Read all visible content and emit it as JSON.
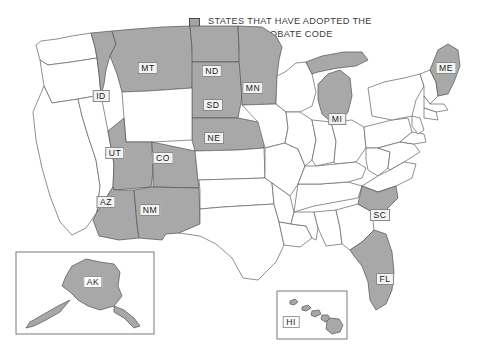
{
  "legend": {
    "swatch_icon": "filled-square-icon",
    "swatch_color": "#a8a8a8",
    "text": "STATES THAT HAVE ADOPTED THE\nUNIFORM PROBATE CODE"
  },
  "map": {
    "title": "Map of the United States",
    "adopted_fill": "#a8a8a8",
    "not_adopted_fill": "#ffffff",
    "border_color": "#6b6b6b",
    "adopted_count": 16,
    "adopted_states": [
      {
        "code": "MT",
        "x": 148,
        "y": 68
      },
      {
        "code": "ND",
        "x": 212,
        "y": 71
      },
      {
        "code": "MN",
        "x": 253,
        "y": 88
      },
      {
        "code": "ID",
        "x": 101,
        "y": 96
      },
      {
        "code": "SD",
        "x": 213,
        "y": 105
      },
      {
        "code": "NE",
        "x": 214,
        "y": 138
      },
      {
        "code": "UT",
        "x": 115,
        "y": 153
      },
      {
        "code": "CO",
        "x": 163,
        "y": 158
      },
      {
        "code": "AZ",
        "x": 106,
        "y": 202
      },
      {
        "code": "NM",
        "x": 150,
        "y": 210
      },
      {
        "code": "MI",
        "x": 337,
        "y": 119
      },
      {
        "code": "ME",
        "x": 446,
        "y": 68
      },
      {
        "code": "SC",
        "x": 380,
        "y": 215
      },
      {
        "code": "FL",
        "x": 385,
        "y": 279
      },
      {
        "code": "AK",
        "x": 93,
        "y": 282
      },
      {
        "code": "HI",
        "x": 291,
        "y": 322
      }
    ],
    "insets": [
      {
        "name": "alaska-inset",
        "code": "AK"
      },
      {
        "name": "hawaii-inset",
        "code": "HI"
      }
    ]
  }
}
